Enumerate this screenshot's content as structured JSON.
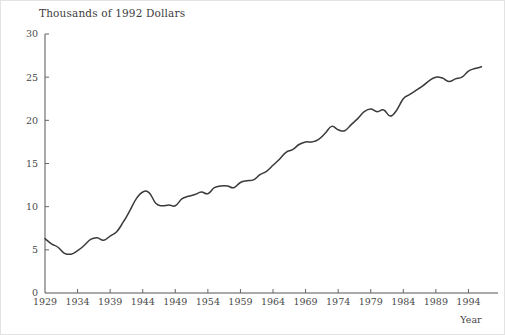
{
  "figure": {
    "background_color": "#ffffff",
    "border_color": "#e3e3e3",
    "line_color": "#3a3a3a",
    "axis_color": "#555555",
    "text_color": "#4a4a4a"
  },
  "chart_data": {
    "type": "line",
    "title": "Thousands of 1992 Dollars",
    "xlabel": "Year",
    "ylabel": "",
    "xlim": [
      1929,
      1997
    ],
    "ylim": [
      0,
      30
    ],
    "grid": false,
    "legend": null,
    "xticks": [
      1929,
      1934,
      1939,
      1944,
      1949,
      1954,
      1959,
      1964,
      1969,
      1974,
      1979,
      1984,
      1989,
      1994
    ],
    "xtick_labels": [
      "1929",
      "1934",
      "1939",
      "1944",
      "1949",
      "1954",
      "1959",
      "1964",
      "1969",
      "1974",
      "1979",
      "1984",
      "1989",
      "1994"
    ],
    "yticks": [
      0,
      5,
      10,
      15,
      20,
      25,
      30
    ],
    "ytick_labels": [
      "0",
      "5",
      "10",
      "15",
      "20",
      "25",
      "30"
    ],
    "x": [
      1929,
      1930,
      1931,
      1932,
      1933,
      1934,
      1935,
      1936,
      1937,
      1938,
      1939,
      1940,
      1941,
      1942,
      1943,
      1944,
      1945,
      1946,
      1947,
      1948,
      1949,
      1950,
      1951,
      1952,
      1953,
      1954,
      1955,
      1956,
      1957,
      1958,
      1959,
      1960,
      1961,
      1962,
      1963,
      1964,
      1965,
      1966,
      1967,
      1968,
      1969,
      1970,
      1971,
      1972,
      1973,
      1974,
      1975,
      1976,
      1977,
      1978,
      1979,
      1980,
      1981,
      1982,
      1983,
      1984,
      1985,
      1986,
      1987,
      1988,
      1989,
      1990,
      1991,
      1992,
      1993,
      1994,
      1995,
      1996
    ],
    "values": [
      6.3,
      5.7,
      5.3,
      4.6,
      4.5,
      4.9,
      5.5,
      6.2,
      6.4,
      6.1,
      6.6,
      7.1,
      8.2,
      9.5,
      10.9,
      11.7,
      11.6,
      10.4,
      10.1,
      10.2,
      10.1,
      10.9,
      11.2,
      11.4,
      11.7,
      11.5,
      12.2,
      12.4,
      12.4,
      12.2,
      12.8,
      13.0,
      13.1,
      13.7,
      14.1,
      14.8,
      15.5,
      16.3,
      16.6,
      17.2,
      17.5,
      17.5,
      17.8,
      18.5,
      19.3,
      18.9,
      18.8,
      19.5,
      20.2,
      21.0,
      21.3,
      21.0,
      21.2,
      20.5,
      21.2,
      22.5,
      23.0,
      23.5,
      24.0,
      24.6,
      25.0,
      24.9,
      24.5,
      24.8,
      25.0,
      25.7,
      26.0,
      26.2
    ],
    "value_unit": "thousands of 1992 dollars"
  }
}
